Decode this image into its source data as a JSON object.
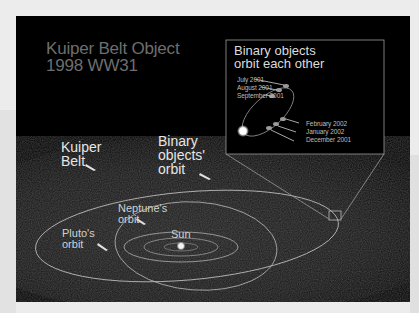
{
  "title": {
    "line1": "Kuiper Belt Object",
    "line2": "1998 WW31"
  },
  "inset": {
    "title_line1": "Binary objects",
    "title_line2": "orbit each other",
    "dates_left": [
      "July 2001",
      "August 2001",
      "September 2001"
    ],
    "dates_right": [
      "February 2002",
      "January 2002",
      "December 2001"
    ]
  },
  "labels": {
    "kuiper_belt": [
      "Kuiper",
      "Belt"
    ],
    "binary_orbit": [
      "Binary",
      "objects'",
      "orbit"
    ],
    "neptune_orbit": [
      "Neptune's",
      "orbit"
    ],
    "pluto_orbit": [
      "Pluto's",
      "orbit"
    ],
    "sun": "Sun"
  },
  "colors": {
    "background": "#000000",
    "orbit_line": "#c8c8c8",
    "title_text": "#6e6e6e",
    "label_text": "#e6e6e6",
    "page_bg": "#ececec"
  }
}
